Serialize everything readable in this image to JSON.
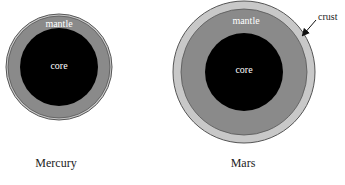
{
  "diagram": {
    "type": "planet-interior-cross-sections",
    "colors": {
      "core": "#000000",
      "mantle": "#8a8a8a",
      "crust": "#c8c8c8",
      "outline": "#555555",
      "inner_text": "#ffffff",
      "outer_text": "#222222"
    },
    "planets": [
      {
        "name": "Mercury",
        "layers": {
          "mantle_label": "mantle",
          "core_label": "core"
        },
        "has_crust_label": false
      },
      {
        "name": "Mars",
        "layers": {
          "mantle_label": "mantle",
          "core_label": "core",
          "crust_label": "crust"
        },
        "has_crust_label": true
      }
    ]
  }
}
